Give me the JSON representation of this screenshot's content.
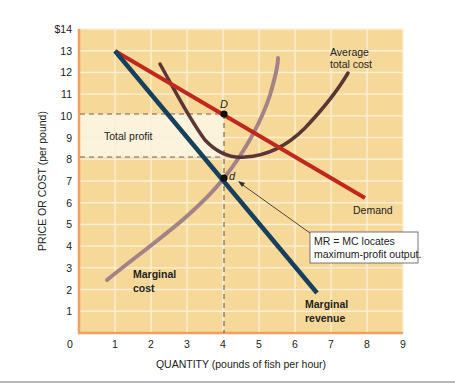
{
  "chart_data": {
    "type": "line",
    "title": "",
    "xlabel": "QUANTITY (pounds of fish per hour)",
    "ylabel": "PRICE OR COST (per pound)",
    "xlim": [
      0,
      9
    ],
    "ylim": [
      0,
      14
    ],
    "x_ticks": [
      "0",
      "1",
      "2",
      "3",
      "4",
      "5",
      "6",
      "7",
      "8",
      "9"
    ],
    "y_ticks": [
      "",
      "1",
      "2",
      "3",
      "4",
      "5",
      "6",
      "7",
      "8",
      "9",
      "10",
      "11",
      "12",
      "13",
      "$14"
    ],
    "grid": true,
    "background_color": "#f6d898",
    "grid_color": "#fcf0d6",
    "axis_color": "#f0a060",
    "series": [
      {
        "name": "Demand",
        "label": "Demand",
        "color": "#c0281e",
        "points": [
          [
            1,
            13
          ],
          [
            2,
            12
          ],
          [
            3,
            11
          ],
          [
            4,
            10
          ],
          [
            5,
            9
          ],
          [
            6,
            8
          ],
          [
            7,
            7
          ],
          [
            7.9,
            6.1
          ]
        ]
      },
      {
        "name": "Marginal revenue",
        "label_line1": "Marginal",
        "label_line2": "revenue",
        "color": "#17405c",
        "points": [
          [
            1,
            13
          ],
          [
            2,
            11
          ],
          [
            3,
            9
          ],
          [
            4,
            7
          ],
          [
            5,
            5
          ],
          [
            6,
            3
          ],
          [
            6.6,
            1.8
          ]
        ]
      },
      {
        "name": "Marginal cost",
        "label_line1": "Marginal",
        "label_line2": "cost",
        "color": "#a48386",
        "points": [
          [
            0.8,
            2.4
          ],
          [
            2,
            3.9
          ],
          [
            3,
            5.3
          ],
          [
            4,
            7
          ],
          [
            4.6,
            8.8
          ],
          [
            5,
            10.5
          ],
          [
            5.3,
            12
          ],
          [
            5.5,
            13
          ]
        ]
      },
      {
        "name": "Average total cost",
        "label_line1": "Average",
        "label_line2": "total cost",
        "color": "#5a3634",
        "points": [
          [
            2.2,
            12.4
          ],
          [
            3,
            10.3
          ],
          [
            3.5,
            9
          ],
          [
            4,
            8.2
          ],
          [
            4.5,
            8
          ],
          [
            5,
            8.1
          ],
          [
            5.5,
            8.6
          ],
          [
            6,
            9.7
          ],
          [
            6.7,
            12.4
          ]
        ]
      }
    ],
    "points": [
      {
        "label": "D",
        "x": 4,
        "y": 10
      },
      {
        "label": "d",
        "x": 4,
        "y": 7
      }
    ],
    "shaded_region": {
      "label": "Total profit",
      "x": [
        0,
        4
      ],
      "y": [
        8,
        10
      ],
      "color": "#fbf3dc"
    },
    "reference_lines": [
      {
        "type": "horizontal-dashed",
        "y": 10,
        "x_to": 4
      },
      {
        "type": "horizontal-dashed",
        "y": 8,
        "x_to": 4
      },
      {
        "type": "vertical-dashed",
        "x": 4,
        "y_from": 0,
        "y_to": 10
      }
    ],
    "annotations": [
      {
        "text_line1": "MR = MC locates",
        "text_line2": "maximum-profit output.",
        "points_to": [
          4,
          7
        ]
      }
    ]
  }
}
